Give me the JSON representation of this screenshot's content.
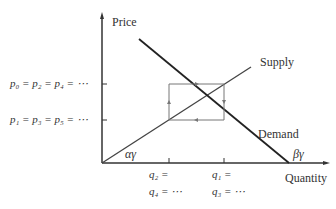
{
  "axes": {
    "y_label": "Price",
    "x_label": "Quantity"
  },
  "curves": {
    "supply_label": "Supply",
    "demand_label": "Demand"
  },
  "price_levels": {
    "high": "p₀ = p₂ = p₄ = ⋯",
    "low": "p₁ = p₃ = p₅ = ⋯"
  },
  "quantity_levels": {
    "left_line1": "q₂ =",
    "left_line2": "q₄ = ⋯",
    "right_line1": "q₁ =",
    "right_line2": "q₃ = ⋯"
  },
  "annotations": {
    "supply_intercept": "αγ",
    "demand_intercept": "βγ"
  },
  "colors": {
    "axis": "#333333",
    "curve": "#333333",
    "cobweb": "#777777"
  }
}
